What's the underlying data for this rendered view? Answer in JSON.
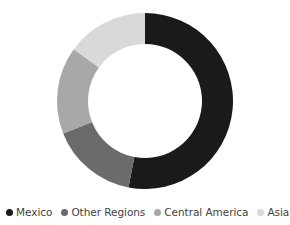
{
  "chart_data": {
    "type": "pie",
    "variant": "donut",
    "title": "",
    "xlabel": "",
    "ylabel": "",
    "grid": false,
    "legend_position": "bottom",
    "start_angle_deg": 0,
    "direction": "clockwise",
    "inner_radius_ratio": 0.65,
    "categories": [
      "Mexico",
      "Other Regions",
      "Central America",
      "Asia"
    ],
    "values": [
      53,
      16,
      16,
      15
    ],
    "colors": [
      "#1a1a1a",
      "#6b6b6b",
      "#a8a8a8",
      "#d9d9d9"
    ],
    "slices": [
      {
        "label": "Mexico",
        "value": 53,
        "color": "#1a1a1a",
        "start_deg": 0,
        "end_deg": 190.8
      },
      {
        "label": "Other Regions",
        "value": 16,
        "color": "#6b6b6b",
        "start_deg": 190.8,
        "end_deg": 248.4
      },
      {
        "label": "Central America",
        "value": 16,
        "color": "#a8a8a8",
        "start_deg": 248.4,
        "end_deg": 306.0
      },
      {
        "label": "Asia",
        "value": 15,
        "color": "#d9d9d9",
        "start_deg": 306.0,
        "end_deg": 360.0
      }
    ]
  },
  "legend": {
    "items": [
      {
        "label": "Mexico",
        "color": "#1a1a1a",
        "marker": "circle-dot-icon"
      },
      {
        "label": "Other Regions",
        "color": "#6b6b6b",
        "marker": "circle-dot-icon"
      },
      {
        "label": "Central America",
        "color": "#a8a8a8",
        "marker": "circle-dot-icon"
      },
      {
        "label": "Asia",
        "color": "#d9d9d9",
        "marker": "circle-dot-icon"
      }
    ]
  },
  "geometry": {
    "center_x": 145,
    "center_y": 101,
    "outer_radius": 88,
    "inner_radius": 57
  }
}
